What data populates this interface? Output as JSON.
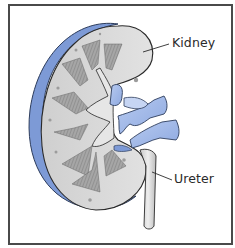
{
  "figure": {
    "labels": [
      {
        "id": "kidney",
        "text": "Kidney"
      },
      {
        "id": "ureter",
        "text": "Ureter"
      }
    ]
  },
  "colors": {
    "capsule_blue": "#7d9ad6",
    "vessel_blue": "#a9bfe8",
    "cortex_gray": "#d3d3d3",
    "pyramid_gray": "#9a9a9a",
    "ureter_gray": "#dcdcdc",
    "frame_border": "#4a4a4a",
    "label_text": "#2a2a2a"
  }
}
